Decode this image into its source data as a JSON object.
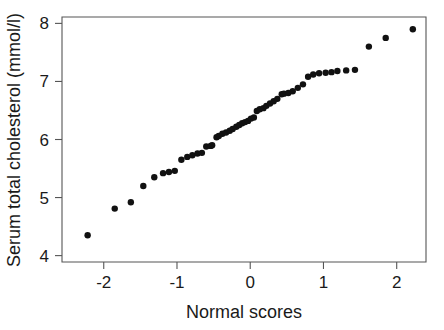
{
  "figure": {
    "background_color": "#ffffff",
    "point_color": "#111111",
    "axis_color": "#555555",
    "text_color": "#1a1a1a"
  },
  "chart_data": {
    "type": "scatter",
    "title": "",
    "subtitle": "",
    "xlabel": "Normal scores",
    "ylabel": "Serum total cholesterol (mmol/l)",
    "xlim": [
      -2.57,
      2.4
    ],
    "ylim": [
      3.89,
      8.11
    ],
    "xticks": [
      -2,
      -1,
      0,
      1,
      2
    ],
    "xtick_labels": [
      "-2",
      "-1",
      "0",
      "1",
      "2"
    ],
    "yticks": [
      4,
      5,
      6,
      7,
      8
    ],
    "ytick_labels": [
      "4",
      "5",
      "6",
      "7",
      "8"
    ],
    "grid": false,
    "legend": false,
    "legend_position": "none",
    "marker": "filled-circle",
    "marker_size": 3.2,
    "x": [
      -2.22,
      -1.85,
      -1.63,
      -1.46,
      -1.31,
      -1.19,
      -1.11,
      -1.03,
      -0.94,
      -0.86,
      -0.79,
      -0.72,
      -0.66,
      -0.6,
      -0.54,
      -0.52,
      -0.46,
      -0.43,
      -0.38,
      -0.33,
      -0.28,
      -0.24,
      -0.19,
      -0.15,
      -0.11,
      -0.07,
      -0.03,
      0.01,
      0.05,
      0.09,
      0.13,
      0.18,
      0.22,
      0.27,
      0.32,
      0.37,
      0.43,
      0.46,
      0.52,
      0.58,
      0.65,
      0.72,
      0.79,
      0.86,
      0.94,
      1.03,
      1.11,
      1.19,
      1.31,
      1.43,
      1.62,
      1.85,
      2.22
    ],
    "y": [
      4.35,
      4.81,
      4.92,
      5.2,
      5.35,
      5.42,
      5.44,
      5.46,
      5.65,
      5.7,
      5.73,
      5.76,
      5.77,
      5.88,
      5.89,
      5.9,
      6.04,
      6.06,
      6.1,
      6.12,
      6.15,
      6.18,
      6.22,
      6.25,
      6.28,
      6.3,
      6.32,
      6.36,
      6.38,
      6.49,
      6.52,
      6.54,
      6.58,
      6.62,
      6.66,
      6.7,
      6.78,
      6.79,
      6.8,
      6.83,
      6.89,
      6.95,
      7.08,
      7.12,
      7.14,
      7.15,
      7.16,
      7.18,
      7.19,
      7.2,
      7.6,
      7.75,
      7.9
    ],
    "n_points": 53
  }
}
